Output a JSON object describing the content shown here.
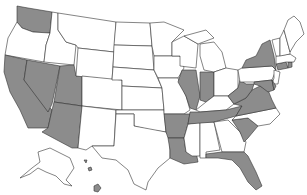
{
  "map": {
    "type": "choropleth",
    "region": "United States",
    "colors": {
      "highlighted": "#8c8c8c",
      "default": "#ffffff",
      "border": "#333333"
    },
    "highlighted_states": [
      "WA",
      "CA",
      "NV",
      "UT",
      "AZ",
      "AR",
      "LA",
      "IL",
      "IN",
      "TN",
      "WV",
      "VA",
      "MD",
      "DE",
      "SC",
      "FL",
      "NY",
      "CT",
      "RI",
      "HI"
    ],
    "unhighlighted_states": [
      "OR",
      "ID",
      "MT",
      "WY",
      "CO",
      "NM",
      "ND",
      "SD",
      "NE",
      "KS",
      "OK",
      "TX",
      "MN",
      "IA",
      "MO",
      "WI",
      "MI",
      "OH",
      "KY",
      "MS",
      "AL",
      "GA",
      "NC",
      "PA",
      "NJ",
      "VT",
      "NH",
      "MA",
      "ME",
      "AK"
    ]
  }
}
